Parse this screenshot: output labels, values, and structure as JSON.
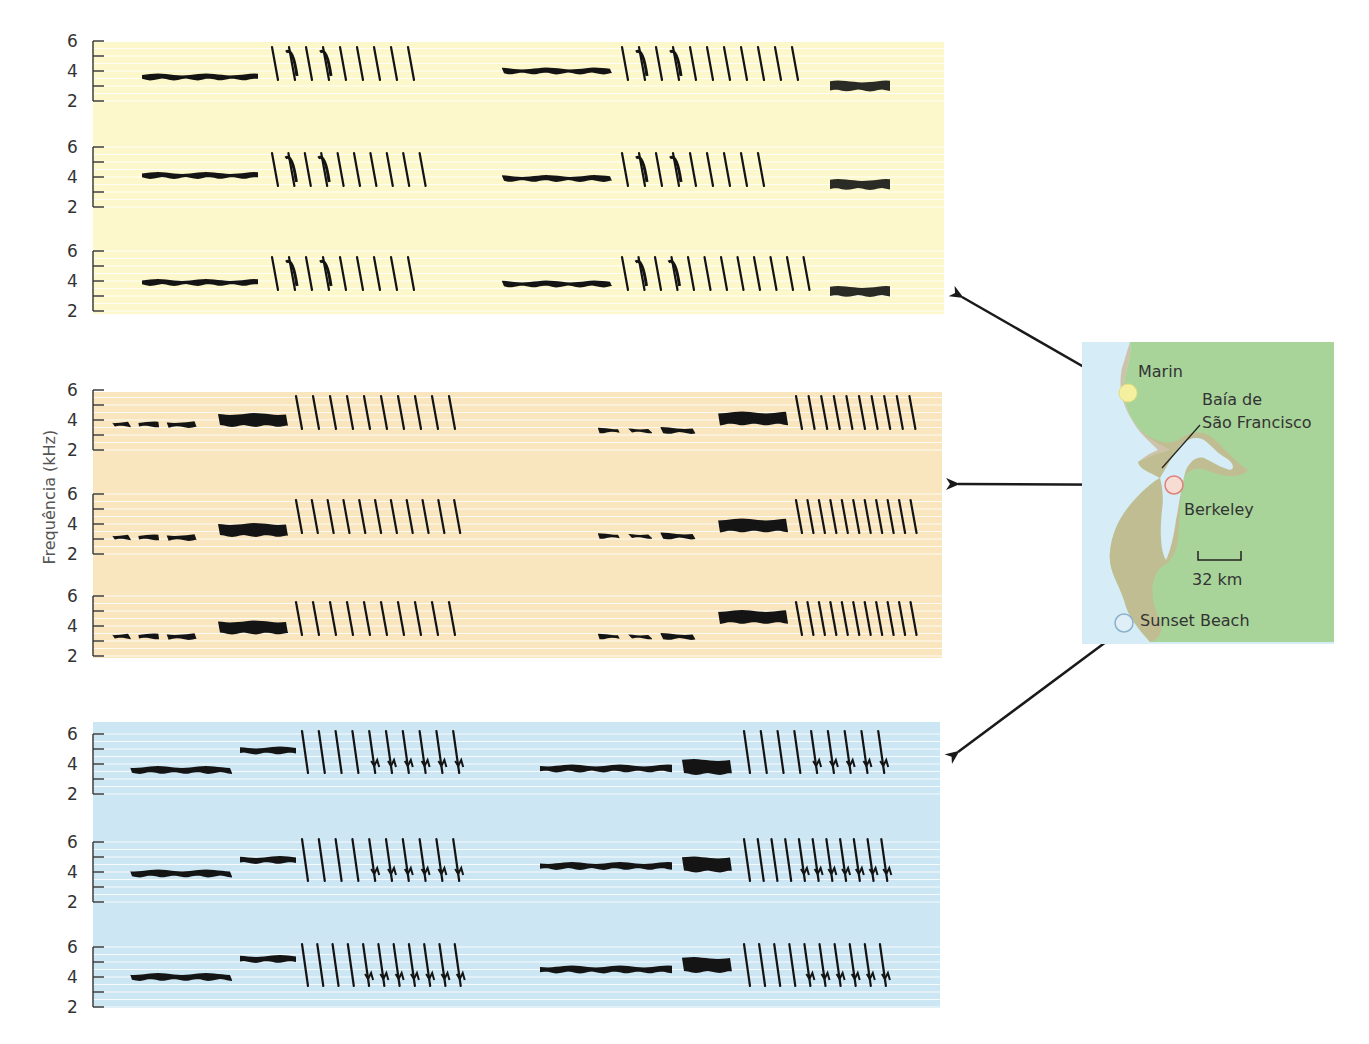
{
  "figure": {
    "y_axis_label": "Frequência (kHz)",
    "y_ticks": [
      "6",
      "4",
      "2"
    ]
  },
  "map": {
    "labels": {
      "marin": "Marin",
      "bay_line1": "Baía de",
      "bay_line2": "São Francisco",
      "berkeley": "Berkeley",
      "scale": "32 km",
      "sunset_beach": "Sunset Beach"
    },
    "markers": [
      {
        "name": "Marin",
        "color": "#f4f0a0",
        "stroke": "#e6df7a"
      },
      {
        "name": "Berkeley",
        "color": "#f7dcd4",
        "stroke": "#e0807a"
      },
      {
        "name": "Sunset Beach",
        "color": "#dfeef7",
        "stroke": "#8ab2cc"
      }
    ]
  },
  "colors": {
    "marin_panel": "#fdf8cc",
    "berkeley_panel": "#f9e6bf",
    "sunset_panel": "#cce6f3",
    "land": "#a8d49a",
    "water": "#d6ecf6",
    "ink": "#141414"
  },
  "chart_data": {
    "type": "spectrogram-panels",
    "title": "",
    "ylabel": "Frequência (kHz)",
    "ylim": [
      2,
      6
    ],
    "panels": [
      {
        "region": "Marin",
        "background": "#fdf8cc",
        "rows": [
          {
            "songs": [
              {
                "tone_kHz": 3.6,
                "trill_syllables": 9
              },
              {
                "tone_kHz": 4.0,
                "trill_syllables": 11,
                "buzz_kHz": 3.0
              }
            ]
          },
          {
            "songs": [
              {
                "tone_kHz": 4.1,
                "trill_syllables": 10
              },
              {
                "tone_kHz": 3.9,
                "trill_syllables": 9,
                "buzz_kHz": 3.5
              }
            ]
          },
          {
            "songs": [
              {
                "tone_kHz": 3.9,
                "trill_syllables": 9
              },
              {
                "tone_kHz": 3.8,
                "trill_syllables": 12,
                "buzz_kHz": 3.3
              }
            ]
          }
        ]
      },
      {
        "region": "Berkeley",
        "background": "#f9e6bf",
        "rows": [
          {
            "songs": [
              {
                "tone_kHz": 3.7,
                "buzz_kHz": 4.0,
                "trill_syllables": 10
              },
              {
                "tone_kHz": 3.3,
                "buzz_kHz": 4.1,
                "trill_syllables": 10
              }
            ]
          },
          {
            "songs": [
              {
                "tone_kHz": 3.1,
                "buzz_kHz": 3.6,
                "trill_syllables": 11
              },
              {
                "tone_kHz": 3.2,
                "buzz_kHz": 3.9,
                "trill_syllables": 11
              }
            ]
          },
          {
            "songs": [
              {
                "tone_kHz": 3.3,
                "buzz_kHz": 3.9,
                "trill_syllables": 10
              },
              {
                "tone_kHz": 3.3,
                "buzz_kHz": 4.6,
                "trill_syllables": 11
              }
            ]
          }
        ]
      },
      {
        "region": "Sunset Beach",
        "background": "#cce6f3",
        "rows": [
          {
            "songs": [
              {
                "tone_kHz": 3.6,
                "tone2_kHz": 4.9,
                "trill_syllables": 10
              },
              {
                "tone_kHz": 3.7,
                "buzz_kHz": 3.8,
                "trill_syllables": 9
              }
            ]
          },
          {
            "songs": [
              {
                "tone_kHz": 3.9,
                "tone2_kHz": 4.8,
                "trill_syllables": 10
              },
              {
                "tone_kHz": 4.4,
                "buzz_kHz": 4.5,
                "trill_syllables": 11
              }
            ]
          },
          {
            "songs": [
              {
                "tone_kHz": 4.0,
                "tone2_kHz": 5.2,
                "trill_syllables": 11
              },
              {
                "tone_kHz": 4.5,
                "buzz_kHz": 4.8,
                "trill_syllables": 10
              }
            ]
          }
        ]
      }
    ]
  }
}
